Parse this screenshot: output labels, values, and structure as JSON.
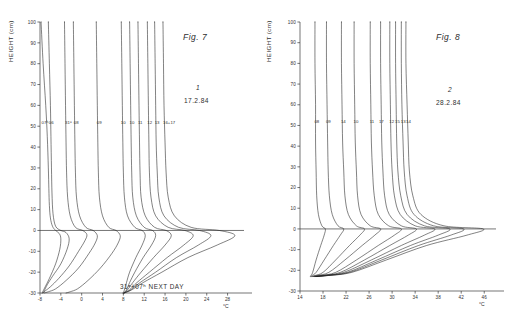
{
  "figures": [
    {
      "id": "fig7",
      "title": "Fig. 7",
      "mark": "1",
      "date": "17.2.84",
      "note": "31ᵃ+07ʰ NEXT DAY",
      "y_axis_label": "HEIGHT (cm)",
      "x_unit": "°C",
      "y_ticks": [
        100,
        90,
        80,
        70,
        60,
        50,
        40,
        30,
        20,
        10,
        0,
        -10,
        -20,
        -30
      ],
      "x_ticks": [
        -8,
        -4,
        0,
        4,
        8,
        12,
        16,
        20,
        24,
        28
      ],
      "curve_labels": [
        "07ʰ",
        "06",
        "31ᵃ",
        "08",
        "09",
        "10",
        "10",
        "11",
        "12",
        "13",
        "16+17"
      ]
    },
    {
      "id": "fig8",
      "title": "Fig. 8",
      "mark": "2",
      "date": "28.2.84",
      "note": "",
      "y_axis_label": "HEIGHT (cm)",
      "x_unit": "°C",
      "y_ticks": [
        100,
        90,
        80,
        70,
        60,
        50,
        40,
        30,
        20,
        10,
        0,
        -10,
        -20,
        -30
      ],
      "x_ticks": [
        14,
        18,
        22,
        26,
        30,
        34,
        38,
        42,
        46
      ],
      "curve_labels": [
        "08",
        "09",
        "14",
        "10",
        "11",
        "17",
        "12",
        "15",
        "13",
        "14"
      ]
    }
  ],
  "chart_data": [
    {
      "type": "line",
      "title": "Fig. 7",
      "xlabel": "°C",
      "ylabel": "HEIGHT (cm)",
      "xlim": [
        -8,
        30
      ],
      "ylim": [
        -30,
        100
      ],
      "grid": false,
      "legend": "none",
      "annotations": [
        "Fig. 7",
        "1",
        "17.2.84",
        "31ᵃ+07ʰ NEXT DAY"
      ],
      "series": [
        {
          "name": "07ʰ",
          "x": [
            -7.8,
            -7.4,
            -6.9,
            -6.6,
            -6.4,
            -6.3,
            -6.2,
            -6.0,
            -5.6,
            -5.0,
            -4.3,
            -4.0,
            -4.2,
            -5.0,
            -6.2,
            -7.0,
            -7.4,
            -7.6
          ],
          "y": [
            100,
            80,
            60,
            45,
            30,
            20,
            12,
            6,
            2,
            0,
            -1.5,
            -4,
            -9,
            -16,
            -23,
            -27,
            -29,
            -30
          ]
        },
        {
          "name": "06",
          "x": [
            -6.4,
            -6.2,
            -6.0,
            -5.9,
            -5.8,
            -5.7,
            -5.5,
            -5.0,
            -4.0,
            -3.0,
            -2.4,
            -2.8,
            -4.0,
            -5.6,
            -6.6,
            -7.2,
            -7.5
          ],
          "y": [
            100,
            80,
            60,
            45,
            30,
            18,
            8,
            2,
            0,
            -1,
            -4,
            -9,
            -16,
            -22,
            -26,
            -29,
            -30
          ]
        },
        {
          "name": "31ᵃ",
          "x": [
            -3.3,
            -3.2,
            -3.1,
            -3.0,
            -2.9,
            -2.7,
            -2.2,
            -1.2,
            0.2,
            1.0,
            0.6,
            -0.6,
            -2.4,
            -4.4,
            -6.0,
            -7.0,
            -7.4
          ],
          "y": [
            100,
            80,
            60,
            42,
            28,
            16,
            7,
            1.5,
            0,
            -2,
            -5,
            -10,
            -17,
            -23,
            -27,
            -29,
            -30
          ]
        },
        {
          "name": "08",
          "x": [
            -1.6,
            -1.5,
            -1.4,
            -1.3,
            -1.2,
            -1.0,
            -0.4,
            0.8,
            2.2,
            3.0,
            2.6,
            1.4,
            -0.6,
            -3.0,
            -5.0,
            -6.4,
            -7.2
          ],
          "y": [
            100,
            80,
            60,
            42,
            28,
            16,
            7,
            1.5,
            0,
            -2.5,
            -6,
            -11,
            -18,
            -24,
            -28,
            -29.4,
            -30
          ]
        },
        {
          "name": "09",
          "x": [
            2.8,
            2.9,
            3.0,
            3.1,
            3.2,
            3.4,
            4.0,
            5.2,
            6.6,
            7.4,
            7.0,
            5.8,
            3.6,
            1.2,
            -0.8,
            -2.2,
            -3.0
          ],
          "y": [
            100,
            80,
            60,
            42,
            28,
            16,
            7,
            1.5,
            0,
            -2.5,
            -6,
            -11,
            -18,
            -24,
            -28,
            -29.4,
            -30
          ]
        },
        {
          "name": "10",
          "x": [
            7.6,
            7.7,
            7.8,
            7.9,
            8.0,
            8.2,
            8.8,
            10.2,
            11.6,
            12.2,
            11.6,
            10.4,
            9.2,
            8.6,
            8.2,
            8.0,
            7.9
          ],
          "y": [
            100,
            80,
            60,
            42,
            28,
            16,
            7,
            1.5,
            0,
            -2.5,
            -7,
            -13,
            -20,
            -25,
            -28.5,
            -29.6,
            -30
          ]
        },
        {
          "name": "10b",
          "x": [
            9.2,
            9.3,
            9.4,
            9.5,
            9.6,
            9.8,
            10.5,
            12.0,
            13.6,
            14.2,
            13.4,
            11.8,
            10.2,
            9.2,
            8.6,
            8.2,
            8.0
          ],
          "y": [
            100,
            80,
            60,
            42,
            28,
            16,
            7,
            1.5,
            0,
            -2.5,
            -7,
            -13,
            -20,
            -25,
            -28.5,
            -29.6,
            -30
          ]
        },
        {
          "name": "11",
          "x": [
            10.8,
            10.9,
            11.0,
            11.1,
            11.2,
            11.4,
            12.2,
            14.0,
            16.2,
            17.2,
            16.0,
            13.8,
            11.4,
            9.8,
            8.8,
            8.3,
            8.05
          ],
          "y": [
            100,
            80,
            60,
            42,
            28,
            16,
            7,
            1.5,
            0,
            -2.5,
            -7,
            -13,
            -20,
            -25,
            -28.5,
            -29.6,
            -30
          ]
        },
        {
          "name": "12",
          "x": [
            12.6,
            12.7,
            12.8,
            12.9,
            13.0,
            13.3,
            14.2,
            16.6,
            19.8,
            21.4,
            19.6,
            16.4,
            13.0,
            10.6,
            9.2,
            8.4,
            8.1
          ],
          "y": [
            100,
            80,
            60,
            42,
            28,
            16,
            7,
            1.5,
            0,
            -2.5,
            -7,
            -13,
            -20,
            -25,
            -28.5,
            -29.6,
            -30
          ]
        },
        {
          "name": "13",
          "x": [
            14.0,
            14.1,
            14.2,
            14.3,
            14.5,
            14.8,
            15.8,
            18.6,
            22.6,
            24.8,
            22.4,
            18.2,
            14.2,
            11.2,
            9.4,
            8.5,
            8.15
          ],
          "y": [
            100,
            80,
            60,
            42,
            28,
            16,
            7,
            1.5,
            0,
            -2.5,
            -7,
            -13,
            -20,
            -25,
            -28.5,
            -29.6,
            -30
          ]
        },
        {
          "name": "16+17",
          "x": [
            15.6,
            15.7,
            15.8,
            16.0,
            16.2,
            16.6,
            17.8,
            21.0,
            26.4,
            29.4,
            26.0,
            20.4,
            15.4,
            11.8,
            9.6,
            8.6,
            8.2
          ],
          "y": [
            100,
            80,
            60,
            42,
            28,
            16,
            7,
            1.5,
            0,
            -2.5,
            -7,
            -13,
            -20,
            -25,
            -28.5,
            -29.6,
            -30
          ]
        }
      ]
    },
    {
      "type": "line",
      "title": "Fig. 8",
      "xlabel": "°C",
      "ylabel": "HEIGHT (cm)",
      "xlim": [
        14,
        47
      ],
      "ylim": [
        -30,
        100
      ],
      "grid": false,
      "legend": "none",
      "annotations": [
        "Fig. 8",
        "2",
        "28.2.84"
      ],
      "series": [
        {
          "name": "08",
          "x": [
            16.6,
            16.6,
            16.7,
            16.7,
            16.8,
            16.9,
            17.2,
            17.8,
            18.4,
            18.2,
            17.6,
            16.8,
            16.2,
            15.9,
            15.8
          ],
          "y": [
            100,
            80,
            60,
            42,
            28,
            16,
            7,
            1.5,
            0,
            -3,
            -8,
            -15,
            -21,
            -22.5,
            -23
          ]
        },
        {
          "name": "09",
          "x": [
            18.6,
            18.6,
            18.7,
            18.8,
            18.9,
            19.1,
            19.6,
            20.6,
            21.6,
            21.0,
            19.8,
            18.2,
            16.8,
            16.1,
            15.85
          ],
          "y": [
            100,
            80,
            60,
            42,
            28,
            16,
            7,
            1.5,
            0,
            -3,
            -8,
            -15,
            -21,
            -22.5,
            -23
          ]
        },
        {
          "name": "14",
          "x": [
            21.2,
            21.2,
            21.3,
            21.4,
            21.6,
            21.8,
            22.4,
            23.8,
            25.2,
            24.4,
            22.6,
            20.2,
            18.0,
            16.6,
            16.0
          ],
          "y": [
            100,
            80,
            60,
            42,
            28,
            16,
            7,
            1.5,
            0,
            -3,
            -8,
            -15,
            -21,
            -22.5,
            -23
          ]
        },
        {
          "name": "10",
          "x": [
            23.4,
            23.4,
            23.5,
            23.6,
            23.8,
            24.0,
            24.6,
            26.2,
            28.0,
            27.0,
            24.8,
            21.8,
            19.0,
            17.0,
            16.1
          ],
          "y": [
            100,
            80,
            60,
            42,
            28,
            16,
            7,
            1.5,
            0,
            -3,
            -8,
            -15,
            -21,
            -22.5,
            -23
          ]
        },
        {
          "name": "11",
          "x": [
            26.2,
            26.2,
            26.3,
            26.4,
            26.6,
            26.9,
            27.6,
            29.4,
            31.6,
            30.4,
            27.6,
            23.8,
            20.2,
            17.6,
            16.3
          ],
          "y": [
            100,
            80,
            60,
            42,
            28,
            16,
            7,
            1.5,
            0,
            -3,
            -8,
            -15,
            -21,
            -22.5,
            -23
          ]
        },
        {
          "name": "17",
          "x": [
            28.0,
            28.0,
            28.1,
            28.2,
            28.4,
            28.7,
            29.5,
            31.6,
            34.2,
            32.8,
            29.6,
            25.2,
            21.0,
            18.0,
            16.5
          ],
          "y": [
            100,
            80,
            60,
            42,
            28,
            16,
            7,
            1.5,
            0,
            -3,
            -8,
            -15,
            -21,
            -22.5,
            -23
          ]
        },
        {
          "name": "12",
          "x": [
            29.6,
            29.6,
            29.7,
            29.8,
            30.0,
            30.4,
            31.4,
            34.0,
            37.4,
            35.6,
            31.6,
            26.4,
            21.6,
            18.3,
            16.6
          ],
          "y": [
            100,
            80,
            60,
            42,
            28,
            16,
            7,
            1.5,
            0,
            -3,
            -8,
            -15,
            -21,
            -22.5,
            -23
          ]
        },
        {
          "name": "15",
          "x": [
            30.6,
            30.6,
            30.7,
            30.8,
            31.0,
            31.5,
            32.6,
            35.6,
            40.0,
            38.0,
            33.2,
            27.4,
            22.2,
            18.6,
            16.7
          ],
          "y": [
            100,
            80,
            60,
            42,
            28,
            16,
            7,
            1.5,
            0,
            -3,
            -8,
            -15,
            -21,
            -22.5,
            -23
          ]
        },
        {
          "name": "13",
          "x": [
            31.6,
            31.6,
            31.7,
            31.9,
            32.1,
            32.6,
            33.8,
            37.2,
            42.4,
            40.2,
            34.6,
            28.2,
            22.6,
            18.8,
            16.8
          ],
          "y": [
            100,
            80,
            60,
            42,
            28,
            16,
            7,
            1.5,
            0,
            -3,
            -8,
            -15,
            -21,
            -22.5,
            -23
          ]
        },
        {
          "name": "14b",
          "x": [
            32.4,
            32.4,
            32.6,
            32.8,
            33.0,
            33.6,
            35.0,
            39.0,
            45.8,
            43.0,
            36.0,
            29.0,
            23.0,
            19.0,
            16.9
          ],
          "y": [
            100,
            80,
            60,
            42,
            28,
            16,
            7,
            1.5,
            0,
            -3,
            -8,
            -15,
            -21,
            -22.5,
            -23
          ]
        }
      ]
    }
  ]
}
